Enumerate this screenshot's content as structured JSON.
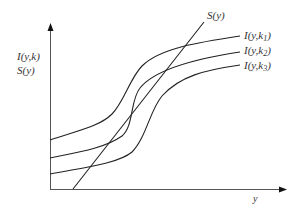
{
  "diagram": {
    "y_axis_label_line1": "I(y,k)",
    "y_axis_label_line2": "S(y)",
    "x_axis_label": "y",
    "curves": [
      {
        "id": "k1",
        "label_main": "I(y,k",
        "label_sub": "1",
        "label_close": ")"
      },
      {
        "id": "k2",
        "label_main": "I(y,k",
        "label_sub": "2",
        "label_close": ")"
      },
      {
        "id": "k3",
        "label_main": "I(y,k",
        "label_sub": "3",
        "label_close": ")"
      }
    ],
    "line_label": "S(y)",
    "colors": {
      "stroke": "#222222",
      "text": "#333333",
      "background": "#ffffff"
    }
  }
}
